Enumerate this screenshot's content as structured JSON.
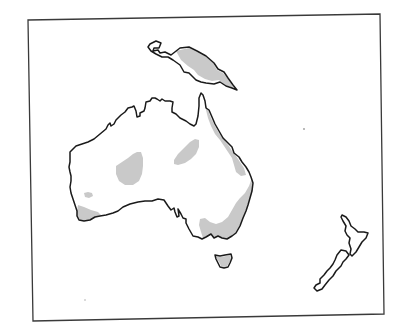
{
  "map": {
    "width": 403,
    "height": 330,
    "colors": {
      "background": "#ffffff",
      "frame": "#3a3a3a",
      "coastline": "#1a1a1a",
      "land": "#ffffff",
      "shaded_region": "#c9c9c9"
    },
    "frame": {
      "points": "28,20 380,14 384,314 33,321"
    },
    "landmasses": [
      {
        "name": "new-guinea",
        "outline": "M150,44 L156,41 L161,43 L159,48 L154,48 L153,51 L158,50 L160,53 L165,52 L171,55 L180,48 L189,47 L197,51 L206,56 L214,63 L218,69 L224,72 L228,78 L233,85 L237,90 L232,88 L226,86 L220,82 L214,84 L206,83 L201,82 L196,80 L192,76 L189,73 L184,72 L180,65 L173,60 L168,57 L162,57 L156,54 L151,51 L148,47 Z",
        "shading": [
          "M176,51 L189,48 L197,52 L206,57 L213,63 L217,70 L223,73 L228,79 L234,88 L225,85 L219,80 L212,81 L205,79 L198,75 L194,70 L188,66 L181,60 Z"
        ]
      },
      {
        "name": "australia",
        "outline": "M70,152 L76,146 L82,144 L88,142 L94,139 L100,134 L106,129 L108,125 L110,123 L111,126 L114,124 L116,120 L119,117 L121,115 L125,112 L128,108 L132,107 L134,106 L136,111 L137,117 L140,116 L140,113 L144,111 L145,108 L146,102 L150,101 L152,98 L155,98 L157,99 L160,101 L162,99 L165,101 L170,101 L173,102 L172,108 L172,112 L176,114 L180,118 L186,121 L190,124 L194,126 L196,124 L198,116 L199,106 L199,98 L201,93 L203,95 L205,101 L206,108 L209,110 L212,117 L215,124 L219,131 L223,138 L228,143 L232,147 L234,153 L239,157 L242,162 L246,167 L249,172 L251,177 L253,183 L252,191 L250,198 L248,205 L246,211 L243,218 L240,226 L236,233 L232,236 L227,239 L222,238 L218,236 L214,238 L211,234 L206,237 L202,239 L198,237 L193,236 L189,229 L186,223 L186,219 L183,218 L181,214 L178,209 L179,216 L177,217 L175,212 L174,208 L171,210 L168,206 L164,200 L158,199 L152,201 L145,201 L138,202 L130,204 L123,207 L118,211 L113,213 L106,215 L100,216 L95,217 L90,220 L84,221 L79,220 L77,216 L77,211 L75,205 L73,199 L71,193 L70,187 L71,181 L71,176 L70,172 L69,167 L70,162 L70,157 Z",
        "shading": [
          "M205,103 L208,110 L211,118 L215,126 L219,133 L224,140 L229,146 L232,151 L236,156 L240,162 L244,168 L246,175 L241,176 L236,172 L234,165 L232,158 L228,152 L224,146 L220,140 L215,134 L211,126 L208,118 L206,110 Z",
          "M252,178 L253,185 L252,192 L250,199 L248,206 L246,212 L243,219 L240,226 L236,233 L232,236 L227,239 L222,238 L218,236 L214,238 L211,234 L206,237 L203,238 L201,232 L199,225 L200,219 L205,218 L210,222 L216,224 L222,222 L228,217 L232,210 L236,203 L240,198 L245,193 L249,186 Z",
          "M78,205 L84,207 L91,210 L98,212 L101,215 L95,217 L90,220 L84,221 L79,220 L77,216 L77,211 Z",
          "M116,166 L122,162 L128,158 L133,154 L137,152 L141,152 L143,158 L143,166 L142,174 L139,181 L133,185 L125,185 L119,181 L116,174 Z",
          "M174,160 L178,154 L184,148 L190,142 L195,139 L199,140 L199,147 L196,154 L191,159 L185,163 L178,165 L174,164 Z",
          "M84,193 L88,192 L92,193 L93,196 L89,198 L85,197 Z"
        ]
      },
      {
        "name": "tasmania",
        "outline": "M215,255 L220,256 L225,255 L231,254 L232,258 L230,263 L228,267 L224,268 L220,267 L218,263 L216,259 Z",
        "shading": [
          "M216,256 L221,257 L226,256 L230,255 L231,259 L229,263 L227,266 L224,267 L221,266 L219,262 L217,259 Z"
        ]
      },
      {
        "name": "new-zealand-north-island",
        "outline": "M342,215 L346,217 L349,221 L351,226 L355,229 L358,232 L364,232 L368,233 L366,238 L362,242 L359,247 L356,252 L352,256 L350,254 L351,249 L349,243 L350,238 L347,235 L345,231 L346,226 L343,221 L341,217 Z",
        "shading": []
      },
      {
        "name": "new-zealand-south-island",
        "outline": "M341,250 L346,251 L349,255 L346,259 L343,262 L341,266 L336,271 L333,276 L329,280 L325,285 L322,289 L317,291 L314,288 L316,285 L320,283 L320,279 L324,275 L327,271 L330,268 L333,264 L335,260 L337,255 Z",
        "shading": []
      }
    ],
    "specks": [
      {
        "name": "speck-east",
        "cx": 304,
        "cy": 129,
        "r": 0.9
      },
      {
        "name": "speck-southwest",
        "cx": 85,
        "cy": 300,
        "r": 0.7
      }
    ]
  }
}
